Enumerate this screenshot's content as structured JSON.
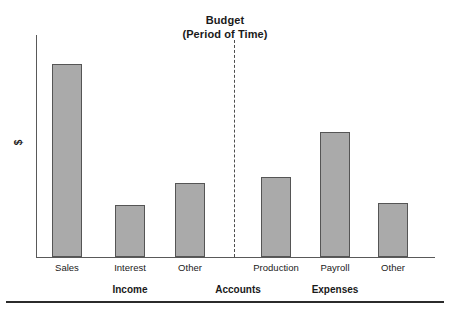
{
  "chart_data": {
    "type": "bar",
    "title": "Budget",
    "subtitle": "(Period of Time)",
    "xlabel": "Accounts",
    "ylabel": "$",
    "grid": false,
    "legend": "none",
    "ylim": [
      0,
      222
    ],
    "axis_note": "Y axis unlabeled; values are relative bar heights in pixels from baseline",
    "categories": [
      "Sales",
      "Interest",
      "Other",
      "Production",
      "Payroll",
      "Other"
    ],
    "values": [
      193,
      52,
      74,
      80,
      125,
      54
    ],
    "groups": [
      {
        "label": "Income",
        "categories": [
          "Sales",
          "Interest",
          "Other"
        ],
        "values": [
          193,
          52,
          74
        ]
      },
      {
        "label": "Expenses",
        "categories": [
          "Production",
          "Payroll",
          "Other"
        ],
        "values": [
          80,
          125,
          54
        ]
      }
    ],
    "divider": {
      "style": "dashed",
      "between": [
        "Income",
        "Expenses"
      ]
    },
    "colors": {
      "bar_fill": "#aaaaaa",
      "bar_border": "#555555",
      "axis": "#595959",
      "text": "#1a1a1a"
    }
  },
  "title": {
    "line1": "Budget",
    "line2": "(Period of Time)"
  },
  "axes": {
    "y_label": "$",
    "x_group_center": "Accounts"
  },
  "bars": [
    {
      "label": "Sales",
      "x": 52,
      "width": 30,
      "top": 64,
      "height": 193
    },
    {
      "label": "Interest",
      "x": 115,
      "width": 30,
      "top": 205,
      "height": 52
    },
    {
      "label": "Other",
      "x": 175,
      "width": 30,
      "top": 183,
      "height": 74
    },
    {
      "label": "Production",
      "x": 261,
      "width": 30,
      "top": 177,
      "height": 80
    },
    {
      "label": "Payroll",
      "x": 320,
      "width": 30,
      "top": 132,
      "height": 125
    },
    {
      "label": "Other",
      "x": 378,
      "width": 30,
      "top": 203,
      "height": 54
    }
  ],
  "category_labels": [
    {
      "text": "Sales",
      "center": 67
    },
    {
      "text": "Interest",
      "center": 130
    },
    {
      "text": "Other",
      "center": 190
    },
    {
      "text": "Production",
      "center": 276
    },
    {
      "text": "Payroll",
      "center": 335
    },
    {
      "text": "Other",
      "center": 393
    }
  ],
  "group_labels": [
    {
      "text": "Income",
      "center": 130
    },
    {
      "text": "Accounts",
      "center": 238
    },
    {
      "text": "Expenses",
      "center": 335
    }
  ]
}
